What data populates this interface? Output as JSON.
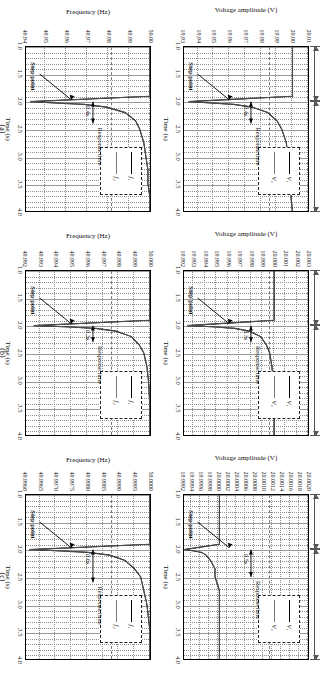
{
  "figure": {
    "panel_tags": [
      "(a)",
      "(b)",
      "(c)"
    ],
    "xlabel": "Time (s)",
    "ylabel_voltage": "Voltage amplitude (V)",
    "ylabel_frequency": "Frequency (Hz)",
    "xticks": [
      "1.0",
      "1.5",
      "2.0",
      "2.5",
      "3.0",
      "3.5",
      "4.0"
    ],
    "span_load1": "Load 1",
    "span_load2": "Load 2 parallel connection",
    "ann_step_point": "Step point",
    "ann_response_time": "Response time",
    "legend_voltage": [
      "V₁",
      "V₂"
    ],
    "legend_frequency": [
      "f₁",
      "f₂"
    ]
  },
  "chart_data": [
    {
      "id": "a-voltage",
      "type": "line",
      "panel": "(a)",
      "title": "",
      "xlabel": "Time (s)",
      "ylabel": "Voltage amplitude (V)",
      "xlim": [
        1.0,
        4.0
      ],
      "ylim": [
        19.93,
        20.01
      ],
      "xticks": [
        1.0,
        1.5,
        2.0,
        2.5,
        3.0,
        3.5,
        4.0
      ],
      "yticks": [
        "20.01",
        "20.00",
        "19.99",
        "19.98",
        "19.97",
        "19.96",
        "19.95",
        "19.94",
        "19.93"
      ],
      "grid": true,
      "legend": [
        "V1",
        "V2"
      ],
      "legend_position": "upper-right-inset",
      "annotations": [
        "Step point",
        "Response time",
        "0.4s"
      ],
      "step_time": 2.0,
      "response_time_s": 0.4,
      "series": [
        {
          "name": "V1",
          "x": [
            1.0,
            1.5,
            1.9,
            2.0,
            2.02,
            2.05,
            2.1,
            2.2,
            2.35,
            2.5,
            2.75,
            3.0,
            3.25,
            3.5,
            3.75,
            4.0
          ],
          "values": [
            20.0,
            20.0,
            20.0,
            19.933,
            19.945,
            19.962,
            19.974,
            19.984,
            19.99,
            19.993,
            19.996,
            19.997,
            19.998,
            19.999,
            19.999,
            20.0
          ]
        },
        {
          "name": "V2",
          "x": [
            1.0,
            1.5,
            1.9,
            2.0,
            2.02,
            2.05,
            2.1,
            2.2,
            2.35,
            2.5,
            2.75,
            3.0,
            3.25,
            3.5,
            3.75,
            4.0
          ],
          "values": [
            20.0,
            20.0,
            20.0,
            19.933,
            19.945,
            19.962,
            19.974,
            19.984,
            19.99,
            19.993,
            19.996,
            19.997,
            19.998,
            19.999,
            19.999,
            20.0
          ]
        }
      ]
    },
    {
      "id": "a-frequency",
      "type": "line",
      "panel": "(a)",
      "xlabel": "Time (s)",
      "ylabel": "Frequency (Hz)",
      "xlim": [
        1.0,
        4.0
      ],
      "ylim": [
        49.94,
        50.0
      ],
      "xticks": [
        1.0,
        1.5,
        2.0,
        2.5,
        3.0,
        3.5,
        4.0
      ],
      "yticks": [
        "50.00",
        "49.99",
        "49.98",
        "49.97",
        "49.96",
        "49.95",
        "49.94"
      ],
      "grid": true,
      "legend": [
        "f1",
        "f2"
      ],
      "legend_position": "upper-right-inset",
      "annotations": [
        "Step point",
        "Response time",
        "0.4s"
      ],
      "step_time": 2.0,
      "response_time_s": 0.4,
      "series": [
        {
          "name": "f1",
          "x": [
            1.0,
            1.5,
            1.9,
            2.0,
            2.02,
            2.05,
            2.1,
            2.2,
            2.35,
            2.5,
            2.75,
            3.0,
            3.25,
            3.5,
            3.75,
            4.0
          ],
          "values": [
            50.0,
            50.0,
            50.0,
            49.942,
            49.952,
            49.968,
            49.979,
            49.988,
            49.993,
            49.995,
            49.997,
            49.998,
            49.999,
            49.999,
            50.0,
            50.0
          ]
        },
        {
          "name": "f2",
          "x": [
            1.0,
            1.5,
            1.9,
            2.0,
            2.02,
            2.05,
            2.1,
            2.2,
            2.35,
            2.5,
            2.75,
            3.0,
            3.25,
            3.5,
            3.75,
            4.0
          ],
          "values": [
            50.0,
            50.0,
            50.0,
            49.942,
            49.952,
            49.968,
            49.979,
            49.988,
            49.993,
            49.995,
            49.997,
            49.998,
            49.999,
            49.999,
            50.0,
            50.0
          ]
        }
      ]
    },
    {
      "id": "b-voltage",
      "type": "line",
      "panel": "(b)",
      "xlabel": "Time (s)",
      "ylabel": "Voltage amplitude (V)",
      "xlim": [
        1.0,
        4.0
      ],
      "ylim": [
        19.992,
        20.003
      ],
      "xticks": [
        1.0,
        1.5,
        2.0,
        2.5,
        3.0,
        3.5,
        4.0
      ],
      "yticks": [
        "20.003",
        "20.002",
        "20.001",
        "20.000",
        "19.999",
        "19.998",
        "19.997",
        "19.996",
        "19.995",
        "19.994",
        "19.993",
        "19.992"
      ],
      "grid": true,
      "legend": [
        "V1",
        "V2"
      ],
      "legend_position": "upper-right-inset",
      "annotations": [
        "Step point",
        "Response time",
        "0.3s"
      ],
      "step_time": 2.0,
      "response_time_s": 0.3,
      "series": [
        {
          "name": "V1",
          "x": [
            1.0,
            1.5,
            1.9,
            2.0,
            2.02,
            2.05,
            2.1,
            2.2,
            2.35,
            2.5,
            2.75,
            3.0,
            3.5,
            4.0
          ],
          "values": [
            20.0,
            20.0,
            20.0,
            19.9923,
            19.9945,
            19.9965,
            19.9978,
            19.9988,
            19.9993,
            19.9996,
            19.9998,
            19.9999,
            20.0,
            20.0
          ]
        },
        {
          "name": "V2",
          "x": [
            1.0,
            1.5,
            1.9,
            2.0,
            2.02,
            2.05,
            2.1,
            2.2,
            2.35,
            2.5,
            2.75,
            3.0,
            3.5,
            4.0
          ],
          "values": [
            20.0,
            20.0,
            20.0,
            19.9923,
            19.9945,
            19.9965,
            19.9978,
            19.9988,
            19.9993,
            19.9996,
            19.9998,
            19.9999,
            20.0,
            20.0
          ]
        }
      ]
    },
    {
      "id": "b-frequency",
      "type": "line",
      "panel": "(b)",
      "xlabel": "Time (s)",
      "ylabel": "Frequency (Hz)",
      "xlim": [
        49.992,
        50.0
      ],
      "ylim": [
        49.992,
        50.0
      ],
      "xticks": [
        1.0,
        1.5,
        2.0,
        2.5,
        3.0,
        3.5,
        4.0
      ],
      "yticks": [
        "50.000",
        "49.999",
        "49.998",
        "49.997",
        "49.996",
        "49.995",
        "49.994",
        "49.993",
        "49.992"
      ],
      "grid": true,
      "legend": [
        "f1",
        "f2"
      ],
      "legend_position": "upper-right-inset",
      "annotations": [
        "Step point",
        "Response time",
        "0.3s"
      ],
      "step_time": 2.0,
      "response_time_s": 0.3,
      "series": [
        {
          "name": "f1",
          "x": [
            1.0,
            1.5,
            1.9,
            2.0,
            2.02,
            2.05,
            2.1,
            2.2,
            2.35,
            2.5,
            2.75,
            3.0,
            3.5,
            4.0
          ],
          "values": [
            50.0,
            50.0,
            50.0,
            49.9925,
            49.9945,
            49.9965,
            49.9978,
            49.9988,
            49.9993,
            49.9996,
            49.9998,
            49.9999,
            50.0,
            50.0
          ]
        },
        {
          "name": "f2",
          "x": [
            1.0,
            1.5,
            1.9,
            2.0,
            2.02,
            2.05,
            2.1,
            2.2,
            2.35,
            2.5,
            2.75,
            3.0,
            3.5,
            4.0
          ],
          "values": [
            50.0,
            50.0,
            50.0,
            49.9925,
            49.9945,
            49.9965,
            49.9978,
            49.9988,
            49.9993,
            49.9996,
            49.9998,
            49.9999,
            50.0,
            50.0
          ]
        }
      ]
    },
    {
      "id": "c-voltage",
      "type": "line",
      "panel": "(c)",
      "xlabel": "Time (s)",
      "ylabel": "Voltage amplitude (V)",
      "xlim": [
        1.0,
        4.0
      ],
      "ylim": [
        19.9992,
        20.002
      ],
      "xticks": [
        1.0,
        1.5,
        2.0,
        2.5,
        3.0,
        3.5,
        4.0
      ],
      "yticks": [
        "20.0020",
        "20.0018",
        "20.0016",
        "20.0014",
        "20.0012",
        "20.0010",
        "20.0008",
        "20.0006",
        "20.0004",
        "20.0002",
        "20.0000",
        "19.9998",
        "19.9996",
        "19.9994",
        "19.9992"
      ],
      "grid": true,
      "legend": [
        "V1",
        "V2"
      ],
      "legend_position": "upper-right-inset",
      "annotations": [
        "Step point",
        "Response time",
        "0.5s"
      ],
      "step_time": 2.0,
      "response_time_s": 0.5,
      "series": [
        {
          "name": "V1",
          "x": [
            1.0,
            1.5,
            1.9,
            2.0,
            2.02,
            2.05,
            2.1,
            2.2,
            2.35,
            2.5,
            2.75,
            3.0,
            3.5,
            4.0
          ],
          "values": [
            20.0,
            20.0,
            20.0,
            19.9992,
            19.9994,
            19.9996,
            19.9997,
            19.9998,
            19.9999,
            19.9999,
            20.0,
            20.0,
            20.0,
            20.0
          ]
        },
        {
          "name": "V2",
          "x": [
            1.0,
            1.5,
            1.9,
            2.0,
            2.02,
            2.05,
            2.1,
            2.2,
            2.35,
            2.5,
            2.75,
            3.0,
            3.5,
            4.0
          ],
          "values": [
            20.0,
            20.0,
            20.0,
            19.9992,
            19.9994,
            19.9996,
            19.9997,
            19.9998,
            19.9999,
            19.9999,
            20.0,
            20.0,
            20.0,
            20.0
          ]
        }
      ]
    },
    {
      "id": "c-frequency",
      "type": "line",
      "panel": "(c)",
      "xlabel": "Time (s)",
      "ylabel": "Frequency (Hz)",
      "xlim": [
        1.0,
        4.0
      ],
      "ylim": [
        49.996,
        50.0
      ],
      "xticks": [
        1.0,
        1.5,
        2.0,
        2.5,
        3.0,
        3.5,
        4.0
      ],
      "yticks": [
        "50.0000",
        "49.9995",
        "49.9990",
        "49.9985",
        "49.9980",
        "49.9975",
        "49.9970",
        "49.9965",
        "49.9960"
      ],
      "grid": true,
      "legend": [
        "f1",
        "f2"
      ],
      "legend_position": "upper-right-inset",
      "annotations": [
        "Step point",
        "Response time",
        "0.6s"
      ],
      "step_time": 2.0,
      "response_time_s": 0.6,
      "series": [
        {
          "name": "f1",
          "x": [
            1.0,
            1.5,
            1.9,
            2.0,
            2.02,
            2.05,
            2.1,
            2.2,
            2.35,
            2.5,
            2.75,
            3.0,
            3.5,
            4.0
          ],
          "values": [
            50.0,
            50.0,
            50.0,
            49.9961,
            49.997,
            49.998,
            49.9987,
            49.9992,
            49.9995,
            49.9997,
            49.9998,
            49.9999,
            50.0,
            50.0
          ]
        },
        {
          "name": "f2",
          "x": [
            1.0,
            1.5,
            1.9,
            2.0,
            2.02,
            2.05,
            2.1,
            2.2,
            2.35,
            2.5,
            2.75,
            3.0,
            3.5,
            4.0
          ],
          "values": [
            50.0,
            50.0,
            50.0,
            49.9961,
            49.997,
            49.998,
            49.9987,
            49.9992,
            49.9995,
            49.9997,
            49.9998,
            49.9999,
            50.0,
            50.0
          ]
        }
      ]
    }
  ]
}
